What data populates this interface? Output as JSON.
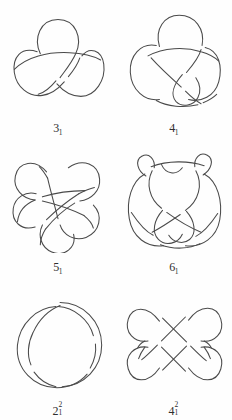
{
  "page": {
    "background_color": "#fefefe",
    "stroke_color": "#4a4a4a",
    "columns": 2,
    "rows": 3
  },
  "knots": [
    {
      "id": "trefoil",
      "name": "trefoil-knot",
      "label_base": "3",
      "label_sub": "1",
      "label_sup": "",
      "label_text": "3₁",
      "crossings": 3,
      "components": 1
    },
    {
      "id": "figure-eight",
      "name": "figure-eight-knot",
      "label_base": "4",
      "label_sub": "1",
      "label_sup": "",
      "label_text": "4₁",
      "crossings": 4,
      "components": 1
    },
    {
      "id": "cinquefoil",
      "name": "cinquefoil-knot",
      "label_base": "5",
      "label_sub": "1",
      "label_sup": "",
      "label_text": "5₁",
      "crossings": 5,
      "components": 1
    },
    {
      "id": "six-one",
      "name": "stevedore-knot",
      "label_base": "6",
      "label_sub": "1",
      "label_sup": "",
      "label_text": "6₁",
      "crossings": 6,
      "components": 1
    },
    {
      "id": "hopf-link",
      "name": "hopf-link",
      "label_base": "2",
      "label_sub": "1",
      "label_sup": "2",
      "label_text": "2²₁",
      "crossings": 2,
      "components": 2
    },
    {
      "id": "solomon-link",
      "name": "solomon-seal-link",
      "label_base": "4",
      "label_sub": "1",
      "label_sup": "2",
      "label_text": "4²₁",
      "crossings": 4,
      "components": 2
    }
  ]
}
